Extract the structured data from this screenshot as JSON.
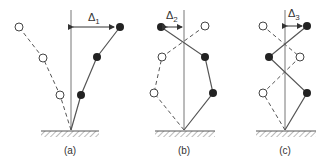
{
  "figure": {
    "colors": {
      "line": "#555555",
      "solid_node": "#222222",
      "open_node": "#ffffff",
      "background": "#ffffff"
    },
    "panels": [
      {
        "id": "a",
        "label": "(a)",
        "delta_label": "Δ",
        "delta_sub": "1",
        "axis_x": 71
      },
      {
        "id": "b",
        "label": "(b)",
        "delta_label": "Δ",
        "delta_sub": "2",
        "axis_x": 184
      },
      {
        "id": "c",
        "label": "(c)",
        "delta_label": "Δ",
        "delta_sub": "3",
        "axis_x": 285
      }
    ]
  }
}
